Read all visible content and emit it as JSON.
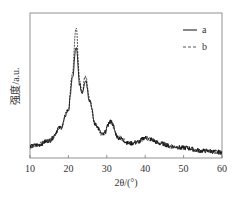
{
  "chart_data": {
    "type": "line",
    "title": "",
    "xlabel": "2θ/(°)",
    "ylabel": "强度/a.u.",
    "xlim": [
      10,
      60
    ],
    "ylim": [
      0,
      100
    ],
    "xticks": [
      10,
      20,
      30,
      40,
      50,
      60
    ],
    "yticks": [],
    "grid": false,
    "legend_position": "upper right",
    "x": [
      10,
      12,
      15,
      18,
      20,
      21,
      22,
      23,
      23.5,
      24.5,
      25.5,
      27,
      29,
      31,
      33,
      36,
      38,
      40,
      41,
      44,
      47,
      50,
      55,
      60
    ],
    "series": [
      {
        "name": "a",
        "style": "solid",
        "values": [
          8,
          9,
          12,
          21,
          33,
          54,
          76,
          50,
          45,
          54,
          40,
          23,
          16,
          25,
          14,
          10,
          11,
          14,
          13,
          10,
          8,
          7,
          5,
          4
        ]
      },
      {
        "name": "b",
        "style": "dashed",
        "values": [
          8,
          9,
          12,
          21,
          34,
          58,
          90,
          52,
          46,
          57,
          41,
          23,
          16,
          25,
          14,
          10,
          11,
          14,
          13,
          10,
          8,
          7,
          5,
          4
        ]
      }
    ]
  },
  "labels": {
    "xlabel": "2θ/(°)",
    "ylabel": "强度/a.u.",
    "legend_a": "a",
    "legend_b": "b",
    "ticks": [
      "10",
      "20",
      "30",
      "40",
      "50",
      "60"
    ]
  }
}
